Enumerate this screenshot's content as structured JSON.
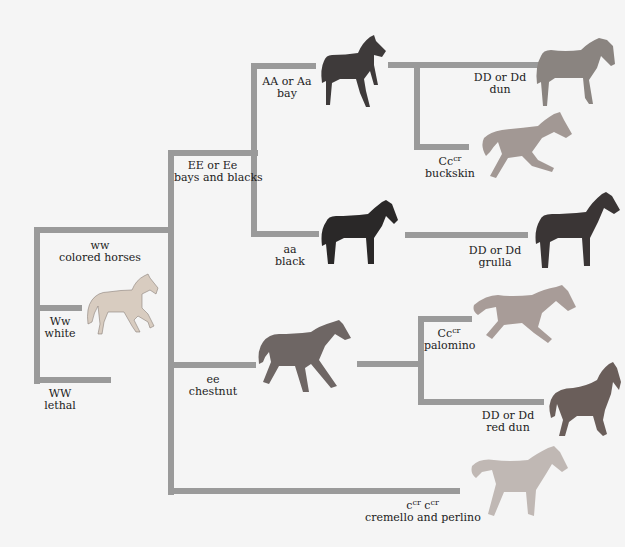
{
  "diagram": {
    "line_color": "#9a9a9a",
    "background": "#f5f5f5",
    "nodes": {
      "ww": {
        "genotype": "ww",
        "phenotype": "colored horses"
      },
      "Ww": {
        "genotype": "Ww",
        "phenotype": "white",
        "horse_color": "#d8ccc0"
      },
      "WW": {
        "genotype": "WW",
        "phenotype": "lethal"
      },
      "E": {
        "genotype": "EE or Ee",
        "phenotype": "bays and blacks"
      },
      "bay": {
        "genotype": "AA or Aa",
        "phenotype": "bay",
        "horse_color": "#3e3a3a"
      },
      "dun": {
        "genotype": "DD or Dd",
        "phenotype": "dun",
        "horse_color": "#8a8480"
      },
      "buckskin": {
        "genotype_base": "Cc",
        "genotype_sup": "cr",
        "phenotype": "buckskin",
        "horse_color": "#a29894"
      },
      "black": {
        "genotype": "aa",
        "phenotype": "black",
        "horse_color": "#2a2828"
      },
      "grulla": {
        "genotype": "DD or Dd",
        "phenotype": "grulla",
        "horse_color": "#3a3535"
      },
      "chestnut": {
        "genotype": "ee",
        "phenotype": "chestnut",
        "horse_color": "#6e6664"
      },
      "palomino": {
        "genotype_base": "Cc",
        "genotype_sup": "cr",
        "phenotype": "palomino",
        "horse_color": "#a89c98"
      },
      "red_dun": {
        "genotype": "DD or Dd",
        "phenotype": "red dun",
        "horse_color": "#6a5e5a"
      },
      "cremello": {
        "genotype_base1": "c",
        "genotype_sup1": "cr",
        "genotype_base2": "c",
        "genotype_sup2": "cr",
        "phenotype": "cremello and perlino",
        "horse_color": "#c0b8b4"
      }
    }
  }
}
